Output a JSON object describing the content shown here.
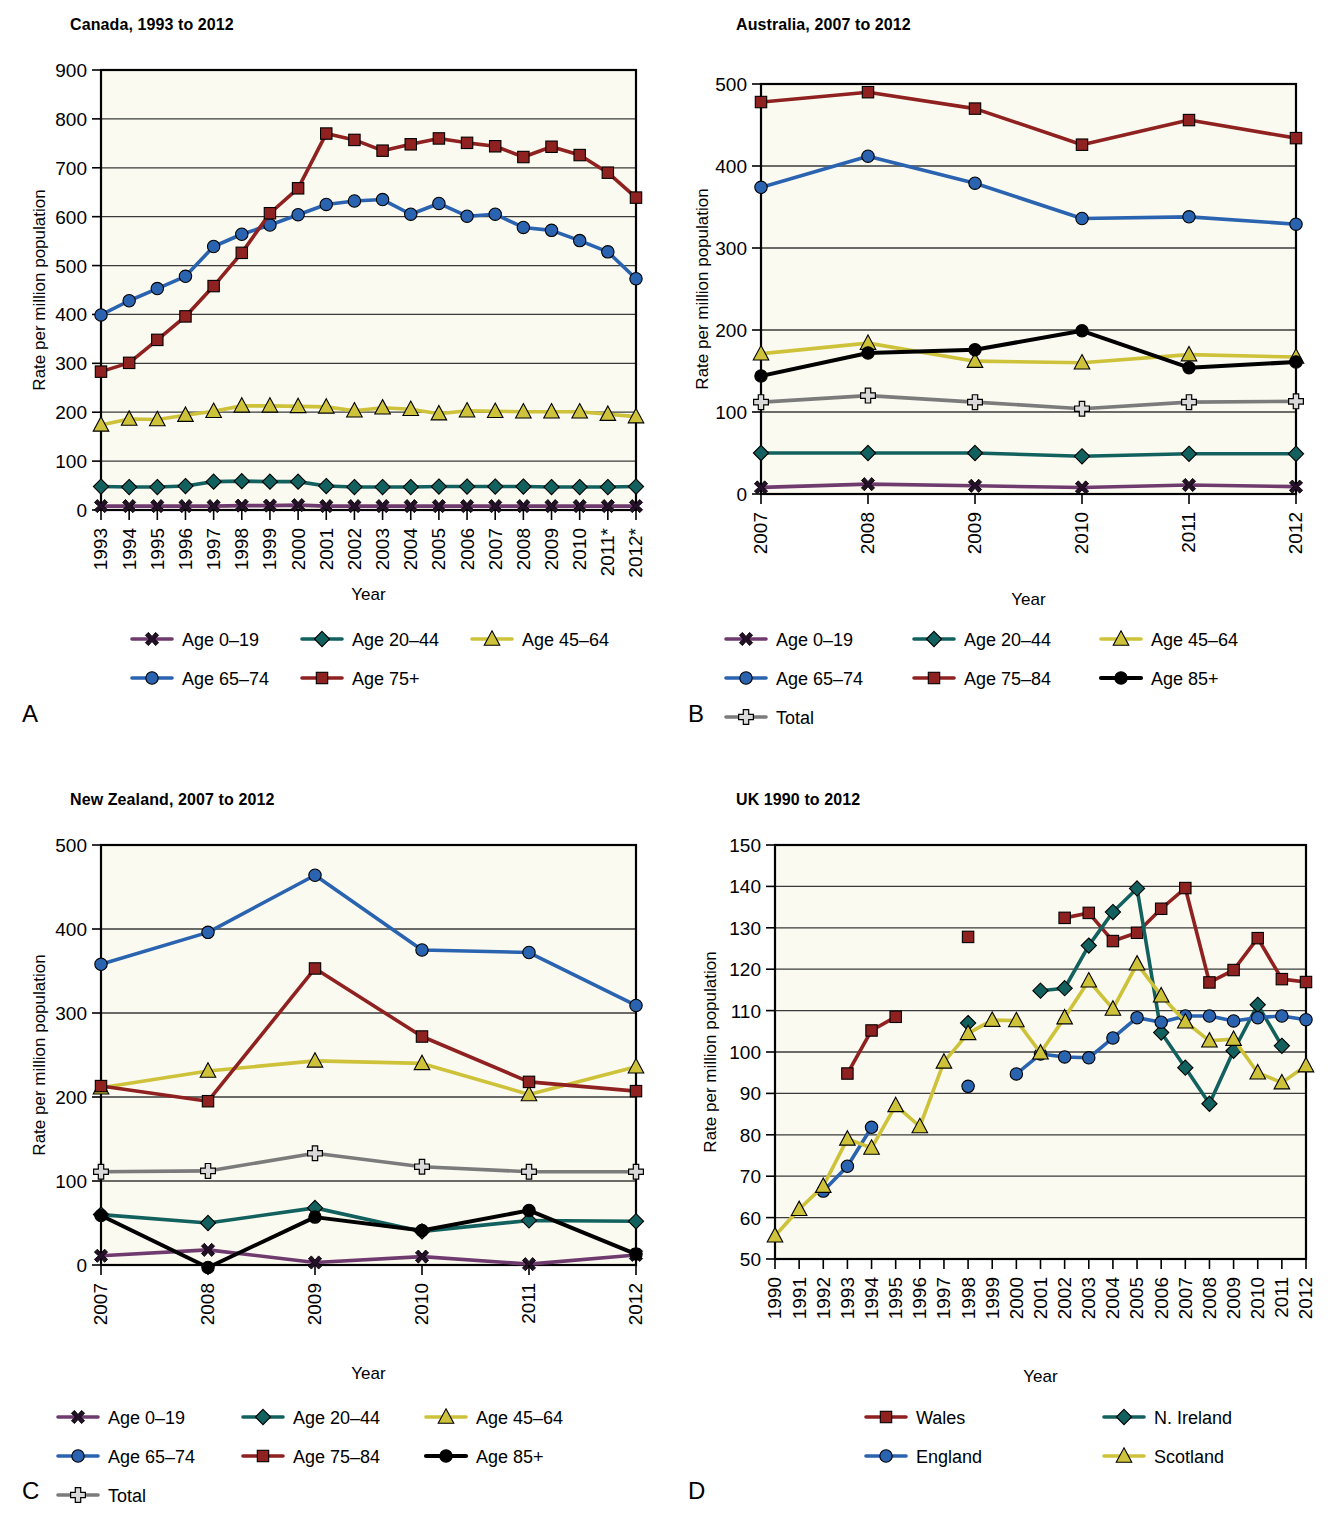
{
  "figure": {
    "axis_y_label": "Rate per million population",
    "axis_x_label": "Year"
  },
  "panels": [
    {
      "key": "A",
      "label": "A",
      "title": "Canada, 1993 to 2012",
      "legend_cols": 3
    },
    {
      "key": "B",
      "label": "B",
      "title": "Australia, 2007 to 2012",
      "legend_cols": 3
    },
    {
      "key": "C",
      "label": "C",
      "title": "New Zealand, 2007 to 2012",
      "legend_cols": 3
    },
    {
      "key": "D",
      "label": "D",
      "title": "UK 1990 to 2012",
      "legend_cols": 2
    }
  ],
  "colors": {
    "age_0_19": "#6f3b6e",
    "age_20_44": "#12615f",
    "age_45_64": "#cdc23a",
    "age_65_74": "#2a63b0",
    "age_75_plus": "#8f2220",
    "age_85_plus": "#000000",
    "total": "#7b7b7b",
    "wales": "#8f2220",
    "n_ireland": "#12615f",
    "england": "#2a63b0",
    "scotland": "#cdc23a",
    "plot_bg": "#fbfaf0",
    "grid": "#3a3a3a"
  },
  "chart_data": [
    {
      "panel": "A",
      "type": "line",
      "title": "Canada, 1993 to 2012",
      "xlabel": "Year",
      "ylabel": "Rate per million population",
      "ylim": [
        0,
        900
      ],
      "yticks": [
        0,
        100,
        200,
        300,
        400,
        500,
        600,
        700,
        800,
        900
      ],
      "grid": true,
      "legend_position": "bottom",
      "categories": [
        "1993",
        "1994",
        "1995",
        "1996",
        "1997",
        "1998",
        "1999",
        "2000",
        "2001",
        "2002",
        "2003",
        "2004",
        "2005",
        "2006",
        "2007",
        "2008",
        "2009",
        "2010",
        "2011*",
        "2012*"
      ],
      "series": [
        {
          "name": "Age 0–19",
          "marker": "x-cross",
          "color_key": "age_0_19",
          "values": [
            8,
            8,
            8,
            8,
            8,
            9,
            9,
            10,
            8,
            8,
            8,
            8,
            8,
            8,
            8,
            8,
            8,
            8,
            8,
            8
          ]
        },
        {
          "name": "Age 20–44",
          "marker": "diamond",
          "color_key": "age_20_44",
          "values": [
            48,
            47,
            47,
            49,
            58,
            59,
            58,
            58,
            49,
            47,
            47,
            47,
            48,
            48,
            48,
            48,
            47,
            47,
            47,
            48
          ]
        },
        {
          "name": "Age 45–64",
          "marker": "triangle",
          "color_key": "age_45_64",
          "values": [
            174,
            186,
            185,
            194,
            202,
            213,
            213,
            212,
            211,
            203,
            209,
            206,
            197,
            203,
            202,
            201,
            201,
            201,
            196,
            191
          ]
        },
        {
          "name": "Age 65–74",
          "marker": "circle",
          "color_key": "age_65_74",
          "values": [
            399,
            428,
            453,
            478,
            539,
            564,
            583,
            604,
            625,
            632,
            635,
            605,
            627,
            601,
            605,
            578,
            572,
            551,
            528,
            473
          ]
        },
        {
          "name": "Age 75+",
          "marker": "square",
          "color_key": "age_75_plus",
          "values": [
            283,
            301,
            348,
            396,
            458,
            526,
            607,
            658,
            770,
            757,
            735,
            748,
            760,
            751,
            744,
            722,
            743,
            726,
            690,
            639
          ]
        }
      ]
    },
    {
      "panel": "B",
      "type": "line",
      "title": "Australia, 2007 to 2012",
      "xlabel": "Year",
      "ylabel": "Rate per million population",
      "ylim": [
        0,
        500
      ],
      "yticks": [
        0,
        100,
        200,
        300,
        400,
        500
      ],
      "grid": true,
      "legend_position": "bottom",
      "categories": [
        "2007",
        "2008",
        "2009",
        "2010",
        "2011",
        "2012"
      ],
      "series": [
        {
          "name": "Age 0–19",
          "marker": "x-cross",
          "color_key": "age_0_19",
          "values": [
            8,
            12,
            10,
            8,
            11,
            9
          ]
        },
        {
          "name": "Age 20–44",
          "marker": "diamond",
          "color_key": "age_20_44",
          "values": [
            50,
            50,
            50,
            46,
            49,
            49
          ]
        },
        {
          "name": "Age 45–64",
          "marker": "triangle",
          "color_key": "age_45_64",
          "values": [
            171,
            184,
            162,
            160,
            170,
            167
          ]
        },
        {
          "name": "Age 65–74",
          "marker": "circle",
          "color_key": "age_65_74",
          "values": [
            374,
            412,
            379,
            336,
            338,
            329
          ]
        },
        {
          "name": "Age 75–84",
          "marker": "square",
          "color_key": "age_75_plus",
          "values": [
            478,
            490,
            470,
            426,
            456,
            434
          ]
        },
        {
          "name": "Age 85+",
          "marker": "circle-black",
          "color_key": "age_85_plus",
          "values": [
            144,
            172,
            176,
            199,
            154,
            161
          ]
        },
        {
          "name": "Total",
          "marker": "plus",
          "color_key": "total",
          "values": [
            112,
            120,
            112,
            104,
            112,
            113
          ]
        }
      ]
    },
    {
      "panel": "C",
      "type": "line",
      "title": "New Zealand, 2007 to 2012",
      "xlabel": "Year",
      "ylabel": "Rate per million population",
      "ylim": [
        0,
        500
      ],
      "yticks": [
        0,
        100,
        200,
        300,
        400,
        500
      ],
      "grid": true,
      "legend_position": "bottom",
      "categories": [
        "2007",
        "2008",
        "2009",
        "2010",
        "2011",
        "2012"
      ],
      "series": [
        {
          "name": "Age 0–19",
          "marker": "x-cross",
          "color_key": "age_0_19",
          "values": [
            11,
            18,
            3,
            10,
            1,
            12
          ]
        },
        {
          "name": "Age 20–44",
          "marker": "diamond",
          "color_key": "age_20_44",
          "values": [
            60,
            50,
            68,
            40,
            53,
            52
          ]
        },
        {
          "name": "Age 45–64",
          "marker": "triangle",
          "color_key": "age_45_64",
          "values": [
            211,
            231,
            243,
            240,
            203,
            236
          ]
        },
        {
          "name": "Age 65–74",
          "marker": "circle",
          "color_key": "age_65_74",
          "values": [
            358,
            396,
            464,
            375,
            372,
            309
          ]
        },
        {
          "name": "Age 75–84",
          "marker": "square",
          "color_key": "age_75_plus",
          "values": [
            213,
            195,
            353,
            272,
            218,
            207
          ]
        },
        {
          "name": "Age 85+",
          "marker": "circle-black",
          "color_key": "age_85_plus",
          "values": [
            59,
            -3,
            57,
            41,
            65,
            13
          ]
        },
        {
          "name": "Total",
          "marker": "plus",
          "color_key": "total",
          "values": [
            111,
            112,
            133,
            117,
            111,
            111
          ]
        }
      ]
    },
    {
      "panel": "D",
      "type": "line",
      "title": "UK 1990 to 2012",
      "xlabel": "Year",
      "ylabel": "Rate per million population",
      "ylim": [
        50,
        150
      ],
      "yticks": [
        50,
        60,
        70,
        80,
        90,
        100,
        110,
        120,
        130,
        140,
        150
      ],
      "grid": true,
      "legend_position": "bottom",
      "categories": [
        "1990",
        "1991",
        "1992",
        "1993",
        "1994",
        "1995",
        "1996",
        "1997",
        "1998",
        "1999",
        "2000",
        "2001",
        "2002",
        "2003",
        "2004",
        "2005",
        "2006",
        "2007",
        "2008",
        "2009",
        "2010",
        "2011",
        "2012"
      ],
      "series": [
        {
          "name": "Wales",
          "marker": "square",
          "color_key": "wales",
          "values": [
            null,
            null,
            null,
            94.8,
            105.2,
            108.5,
            null,
            null,
            127.8,
            null,
            null,
            null,
            132.4,
            133.6,
            126.8,
            128.8,
            134.6,
            139.6,
            116.8,
            119.8,
            127.5,
            117.6,
            116.9
          ]
        },
        {
          "name": "N. Ireland",
          "marker": "diamond",
          "color_key": "n_ireland",
          "values": [
            null,
            null,
            null,
            null,
            null,
            null,
            null,
            null,
            107.0,
            null,
            null,
            114.8,
            115.4,
            125.7,
            133.8,
            139.5,
            104.7,
            96.2,
            87.5,
            100.3,
            111.4,
            101.5,
            null
          ]
        },
        {
          "name": "England",
          "marker": "circle",
          "color_key": "england",
          "values": [
            null,
            null,
            66.4,
            72.4,
            81.8,
            null,
            null,
            null,
            91.7,
            null,
            94.7,
            99.5,
            98.8,
            98.6,
            103.4,
            108.3,
            107.2,
            108.7,
            108.7,
            107.5,
            108.3,
            108.7,
            107.8
          ]
        },
        {
          "name": "Scotland",
          "marker": "triangle",
          "color_key": "scotland",
          "values": [
            55.6,
            62.0,
            67.6,
            79.0,
            76.8,
            87.1,
            82.0,
            97.6,
            104.5,
            107.7,
            107.6,
            99.8,
            108.3,
            117.2,
            110.4,
            121.3,
            113.6,
            107.3,
            102.7,
            103.1,
            95.0,
            92.6,
            96.7
          ]
        }
      ]
    }
  ],
  "legends": {
    "A": [
      {
        "label": "Age 0–19",
        "marker": "x-cross",
        "color_key": "age_0_19"
      },
      {
        "label": "Age 20–44",
        "marker": "diamond",
        "color_key": "age_20_44"
      },
      {
        "label": "Age 45–64",
        "marker": "triangle",
        "color_key": "age_45_64"
      },
      {
        "label": "Age 65–74",
        "marker": "circle",
        "color_key": "age_65_74"
      },
      {
        "label": "Age 75+",
        "marker": "square",
        "color_key": "age_75_plus"
      }
    ],
    "B": [
      {
        "label": "Age 0–19",
        "marker": "x-cross",
        "color_key": "age_0_19"
      },
      {
        "label": "Age 20–44",
        "marker": "diamond",
        "color_key": "age_20_44"
      },
      {
        "label": "Age 45–64",
        "marker": "triangle",
        "color_key": "age_45_64"
      },
      {
        "label": "Age 65–74",
        "marker": "circle",
        "color_key": "age_65_74"
      },
      {
        "label": "Age 75–84",
        "marker": "square",
        "color_key": "age_75_plus"
      },
      {
        "label": "Age 85+",
        "marker": "circle-black",
        "color_key": "age_85_plus"
      },
      {
        "label": "Total",
        "marker": "plus",
        "color_key": "total"
      }
    ],
    "C": [
      {
        "label": "Age 0–19",
        "marker": "x-cross",
        "color_key": "age_0_19"
      },
      {
        "label": "Age 20–44",
        "marker": "diamond",
        "color_key": "age_20_44"
      },
      {
        "label": "Age 45–64",
        "marker": "triangle",
        "color_key": "age_45_64"
      },
      {
        "label": "Age 65–74",
        "marker": "circle",
        "color_key": "age_65_74"
      },
      {
        "label": "Age 75–84",
        "marker": "square",
        "color_key": "age_75_plus"
      },
      {
        "label": "Age 85+",
        "marker": "circle-black",
        "color_key": "age_85_plus"
      },
      {
        "label": "Total",
        "marker": "plus",
        "color_key": "total"
      }
    ],
    "D": [
      {
        "label": "Wales",
        "marker": "square",
        "color_key": "wales"
      },
      {
        "label": "N. Ireland",
        "marker": "diamond",
        "color_key": "n_ireland"
      },
      {
        "label": "England",
        "marker": "circle",
        "color_key": "england"
      },
      {
        "label": "Scotland",
        "marker": "triangle",
        "color_key": "scotland"
      }
    ]
  }
}
